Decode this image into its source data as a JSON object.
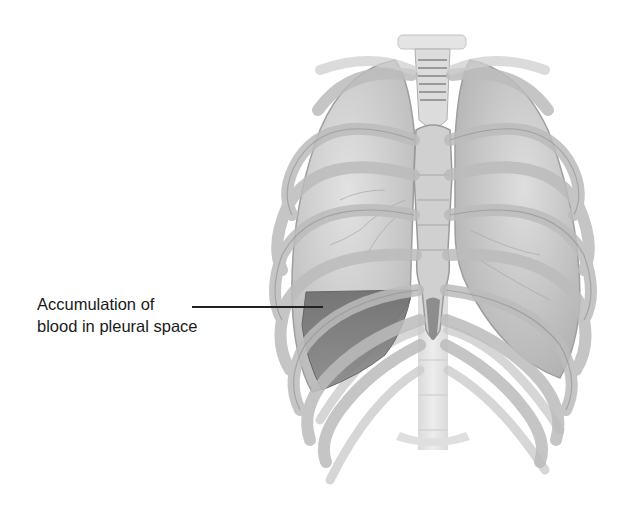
{
  "figure": {
    "annotations": [
      {
        "id": "blood-accumulation",
        "lines": [
          "Accumulation of",
          "blood in pleural space"
        ],
        "points_to": "right-side-of-image lower lung pleural region"
      }
    ],
    "colors": {
      "background": "#ffffff",
      "bone": "#c8c8c8",
      "bone_shadow": "#9a9a9a",
      "lung": "#d6d6d6",
      "blood": "#7a7a7a",
      "label_text": "#1a1a1a",
      "leader_line": "#222222"
    }
  }
}
